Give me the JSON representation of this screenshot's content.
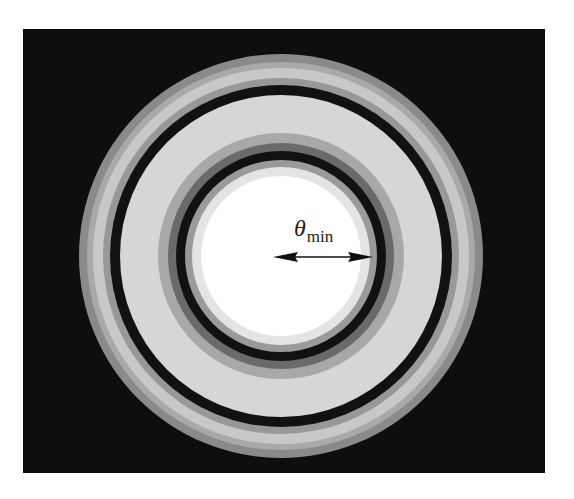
{
  "figure": {
    "background_color": "#0e0e0e",
    "center": {
      "x": 281,
      "y": 256
    },
    "rings": [
      {
        "name": "outer-gray-ring",
        "outer_radius": 202,
        "color": "#8a8a8a"
      },
      {
        "name": "outer-mid-gray-ring",
        "outer_radius": 194,
        "color": "#a9a9a9"
      },
      {
        "name": "outer-light-ring",
        "outer_radius": 188,
        "color": "#c8c8c8"
      },
      {
        "name": "outer-gray-edge-ring",
        "outer_radius": 178,
        "color": "#989898"
      },
      {
        "name": "second-dark-ring",
        "outer_radius": 171,
        "color": "#111111"
      },
      {
        "name": "first-bright-ring",
        "outer_radius": 161,
        "color": "#d6d6d6"
      },
      {
        "name": "first-bright-inner-gray",
        "outer_radius": 123,
        "color": "#a8a8a8"
      },
      {
        "name": "first-dark-ring-shade",
        "outer_radius": 113,
        "color": "#6a6a6a"
      },
      {
        "name": "first-dark-ring",
        "outer_radius": 105,
        "color": "#111111"
      },
      {
        "name": "central-disk-edge",
        "outer_radius": 96,
        "color": "#9a9a9a"
      },
      {
        "name": "central-disk-halo",
        "outer_radius": 89,
        "color": "#e4e4e4"
      },
      {
        "name": "central-disk",
        "outer_radius": 80,
        "color": "#ffffff"
      }
    ],
    "annotation": {
      "symbol": "θ",
      "subscript": "min",
      "arrow": {
        "x1": 273,
        "x2": 373,
        "y": 257,
        "color": "#111111"
      }
    }
  }
}
